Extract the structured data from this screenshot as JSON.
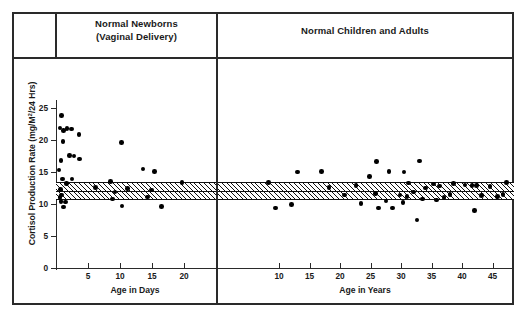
{
  "figure": {
    "panels": {
      "left": {
        "title_line1": "Normal Newborns",
        "title_line2": "(Vaginal Delivery)"
      },
      "right": {
        "title": "Normal Children and Adults"
      }
    }
  },
  "chart_data": {
    "type": "scatter",
    "title": "",
    "ylabel": "Cortisol Production Rate (mg/M2/24 Hrs)",
    "ylabel_parts": {
      "pre": "Cortisol Production Rate (mg/M",
      "sup": "2",
      "post": "/24 Hrs)"
    },
    "ylim": [
      0,
      26.5
    ],
    "yticks": [
      0,
      5,
      10,
      15,
      20,
      25
    ],
    "ytick_labels": [
      "0",
      "5",
      "10",
      "15",
      "20",
      "25"
    ],
    "grid": false,
    "legend": null,
    "reference_band": {
      "label": "normal range (hatched)",
      "upper": 13.4,
      "lower": 10.6,
      "mean": 12.0,
      "fill": "hatched",
      "color": "#111111"
    },
    "panels": [
      {
        "name": "Normal Newborns (Vaginal Delivery)",
        "xlabel": "Age in Days",
        "xlim": [
          0,
          25
        ],
        "xticks": [
          5,
          10,
          15,
          20
        ],
        "xtick_labels": [
          "5",
          "10",
          "15",
          "20"
        ],
        "points": [
          {
            "x": 0.9,
            "y": 23.8
          },
          {
            "x": 0.6,
            "y": 21.9
          },
          {
            "x": 1.7,
            "y": 21.8
          },
          {
            "x": 2.4,
            "y": 21.7
          },
          {
            "x": 1.2,
            "y": 21.5
          },
          {
            "x": 3.6,
            "y": 20.9
          },
          {
            "x": 1.1,
            "y": 19.8
          },
          {
            "x": 10.2,
            "y": 19.6
          },
          {
            "x": 2.1,
            "y": 17.6
          },
          {
            "x": 2.8,
            "y": 17.5
          },
          {
            "x": 0.8,
            "y": 16.8
          },
          {
            "x": 3.7,
            "y": 17.0
          },
          {
            "x": 0.5,
            "y": 15.3
          },
          {
            "x": 13.6,
            "y": 15.5
          },
          {
            "x": 15.4,
            "y": 15.1
          },
          {
            "x": 1.0,
            "y": 13.9
          },
          {
            "x": 2.5,
            "y": 13.9
          },
          {
            "x": 8.5,
            "y": 13.5
          },
          {
            "x": 19.7,
            "y": 13.4
          },
          {
            "x": 1.6,
            "y": 13.2
          },
          {
            "x": 6.2,
            "y": 12.6
          },
          {
            "x": 11.2,
            "y": 12.4
          },
          {
            "x": 14.9,
            "y": 12.2
          },
          {
            "x": 0.7,
            "y": 12.3
          },
          {
            "x": 9.2,
            "y": 11.9
          },
          {
            "x": 0.9,
            "y": 11.4
          },
          {
            "x": 0.6,
            "y": 11.0
          },
          {
            "x": 14.3,
            "y": 11.1
          },
          {
            "x": 8.8,
            "y": 10.8
          },
          {
            "x": 0.8,
            "y": 10.4
          },
          {
            "x": 1.5,
            "y": 10.3
          },
          {
            "x": 10.3,
            "y": 9.7
          },
          {
            "x": 1.2,
            "y": 9.5
          },
          {
            "x": 16.5,
            "y": 9.6
          }
        ]
      },
      {
        "name": "Normal Children and Adults",
        "xlabel": "Age in Years",
        "xlim": [
          0,
          48.5
        ],
        "xticks": [
          10,
          15,
          20,
          25,
          30,
          35,
          40,
          45
        ],
        "xtick_labels": [
          "10",
          "15",
          "20",
          "25",
          "30",
          "35",
          "40",
          "45"
        ],
        "points": [
          {
            "x": 13.0,
            "y": 15.0
          },
          {
            "x": 17.0,
            "y": 15.1
          },
          {
            "x": 26.0,
            "y": 16.6
          },
          {
            "x": 24.8,
            "y": 14.3
          },
          {
            "x": 33.0,
            "y": 16.7
          },
          {
            "x": 30.5,
            "y": 15.0
          },
          {
            "x": 28.0,
            "y": 15.1
          },
          {
            "x": 8.3,
            "y": 13.4
          },
          {
            "x": 18.2,
            "y": 12.6
          },
          {
            "x": 22.6,
            "y": 12.9
          },
          {
            "x": 31.2,
            "y": 13.3
          },
          {
            "x": 35.3,
            "y": 13.1
          },
          {
            "x": 38.6,
            "y": 13.2
          },
          {
            "x": 40.5,
            "y": 13.0
          },
          {
            "x": 41.6,
            "y": 12.9
          },
          {
            "x": 42.4,
            "y": 12.9
          },
          {
            "x": 44.6,
            "y": 12.7
          },
          {
            "x": 47.3,
            "y": 13.4
          },
          {
            "x": 34.0,
            "y": 12.5
          },
          {
            "x": 36.3,
            "y": 12.8
          },
          {
            "x": 20.7,
            "y": 11.4
          },
          {
            "x": 25.8,
            "y": 11.6
          },
          {
            "x": 29.8,
            "y": 11.4
          },
          {
            "x": 32.0,
            "y": 11.9
          },
          {
            "x": 31.0,
            "y": 11.2
          },
          {
            "x": 38.0,
            "y": 11.5
          },
          {
            "x": 43.2,
            "y": 11.3
          },
          {
            "x": 45.8,
            "y": 11.2
          },
          {
            "x": 46.7,
            "y": 11.5
          },
          {
            "x": 35.8,
            "y": 10.6
          },
          {
            "x": 27.5,
            "y": 10.5
          },
          {
            "x": 33.5,
            "y": 10.8
          },
          {
            "x": 37.0,
            "y": 11.0
          },
          {
            "x": 12.0,
            "y": 9.9
          },
          {
            "x": 9.4,
            "y": 9.4
          },
          {
            "x": 23.4,
            "y": 10.1
          },
          {
            "x": 26.3,
            "y": 9.4
          },
          {
            "x": 28.6,
            "y": 9.4
          },
          {
            "x": 30.3,
            "y": 10.2
          },
          {
            "x": 32.6,
            "y": 7.5
          },
          {
            "x": 42.0,
            "y": 9.0
          }
        ]
      }
    ]
  }
}
